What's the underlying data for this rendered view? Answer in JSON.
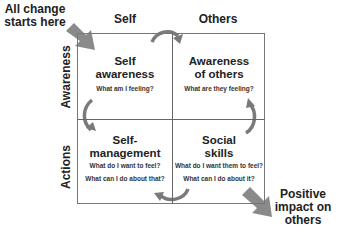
{
  "diagram": {
    "start_callout": "All change\nstarts here",
    "start_callout_lines": [
      "All change",
      "starts here"
    ],
    "end_callout_lines": [
      "Positive",
      "impact on",
      "others"
    ],
    "columns": [
      "Self",
      "Others"
    ],
    "rows": [
      "Awareness",
      "Actions"
    ],
    "quadrants": [
      {
        "id": "self-awareness",
        "title_lines": [
          "Self",
          "awareness"
        ],
        "questions": [
          "What am I feeling?"
        ]
      },
      {
        "id": "awareness-of-others",
        "title_lines": [
          "Awareness",
          "of others"
        ],
        "questions": [
          "What are they feeling?"
        ]
      },
      {
        "id": "self-management",
        "title_lines": [
          "Self-",
          "management"
        ],
        "questions": [
          "What do I want to feel?",
          "What can I do about that?"
        ]
      },
      {
        "id": "social-skills",
        "title_lines": [
          "Social",
          "skills"
        ],
        "questions": [
          "What do I want them to feel?",
          "What can I do about it?"
        ]
      }
    ],
    "colors": {
      "arrow": "#8a8a8a",
      "line": "#666666",
      "text": "#222222"
    }
  }
}
